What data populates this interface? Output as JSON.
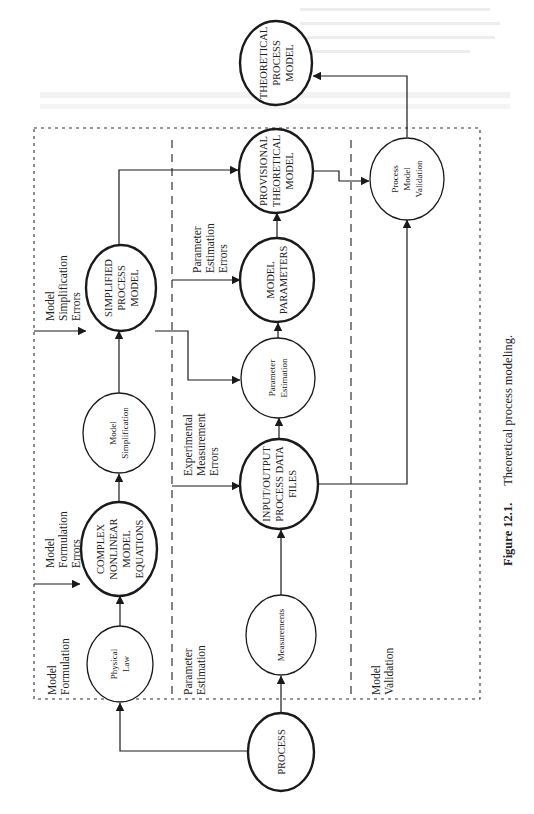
{
  "figure": {
    "number": "Figure 12.1.",
    "title": "Theoretical process modeling.",
    "orientation": "rotated 90° counter-clockwise (landscape figure on portrait page)"
  },
  "regions": [
    {
      "id": "model-formulation",
      "label_lines": [
        "Model",
        "Formulation"
      ]
    },
    {
      "id": "parameter-estimation",
      "label_lines": [
        "Parameter",
        "Estimation"
      ]
    },
    {
      "id": "model-validation",
      "label_lines": [
        "Model",
        "Validation"
      ]
    }
  ],
  "nodes": {
    "process": {
      "lines": [
        "PROCESS"
      ],
      "style": "bold"
    },
    "physical_law": {
      "lines": [
        "Physical",
        "Law"
      ],
      "style": "thin"
    },
    "complex_equations": {
      "lines": [
        "COMPLEX",
        "NONLINEAR",
        "MODEL",
        "EQUATIONS"
      ],
      "style": "bold"
    },
    "model_simplification": {
      "lines": [
        "Model",
        "Simplification"
      ],
      "style": "thin"
    },
    "simplified_model": {
      "lines": [
        "SIMPLIFIED",
        "PROCESS",
        "MODEL"
      ],
      "style": "bold"
    },
    "measurements": {
      "lines": [
        "Measurements"
      ],
      "style": "thin"
    },
    "io_data_files": {
      "lines": [
        "INPUT/OUTPUT",
        "PROCESS DATA",
        "FILES"
      ],
      "style": "bold"
    },
    "parameter_estimation": {
      "lines": [
        "Parameter",
        "Estimation"
      ],
      "style": "thin"
    },
    "model_parameters": {
      "lines": [
        "MODEL",
        "PARAMETERS"
      ],
      "style": "bold"
    },
    "provisional_model": {
      "lines": [
        "PROVISIONAL",
        "THEORETICAL",
        "MODEL"
      ],
      "style": "bold"
    },
    "process_model_validation": {
      "lines": [
        "Process",
        "Model",
        "Validation"
      ],
      "style": "thin"
    },
    "theoretical_model": {
      "lines": [
        "THEORETICAL",
        "PROCESS",
        "MODEL"
      ],
      "style": "bold"
    }
  },
  "error_labels": {
    "formulation": [
      "Model",
      "Formulation",
      "Errors"
    ],
    "simplification": [
      "Model",
      "Simplification",
      "Errors"
    ],
    "measurement": [
      "Experimental",
      "Measurement",
      "Errors"
    ],
    "estimation": [
      "Parameter",
      "Estimation",
      "Errors"
    ]
  },
  "edges": [
    {
      "from": "process",
      "to": "physical_law"
    },
    {
      "from": "process",
      "to": "measurements"
    },
    {
      "from": "physical_law",
      "to": "complex_equations"
    },
    {
      "from": "complex_equations",
      "to": "model_simplification"
    },
    {
      "from": "model_simplification",
      "to": "simplified_model"
    },
    {
      "from": "simplified_model",
      "to": "provisional_model"
    },
    {
      "from": "simplified_model",
      "to": "parameter_estimation"
    },
    {
      "from": "measurements",
      "to": "io_data_files"
    },
    {
      "from": "io_data_files",
      "to": "parameter_estimation"
    },
    {
      "from": "io_data_files",
      "to": "process_model_validation"
    },
    {
      "from": "parameter_estimation",
      "to": "model_parameters"
    },
    {
      "from": "model_parameters",
      "to": "provisional_model"
    },
    {
      "from": "provisional_model",
      "to": "process_model_validation"
    },
    {
      "from": "process_model_validation",
      "to": "theoretical_model"
    },
    {
      "from": "formulation_errors",
      "to": "complex_equations"
    },
    {
      "from": "simplification_errors",
      "to": "simplified_model"
    },
    {
      "from": "measurement_errors",
      "to": "io_data_files"
    },
    {
      "from": "estimation_errors",
      "to": "model_parameters"
    }
  ],
  "colors": {
    "ink": "#1a1a1a",
    "paper": "#ffffff",
    "bleed_through": "#d8d8d8"
  }
}
